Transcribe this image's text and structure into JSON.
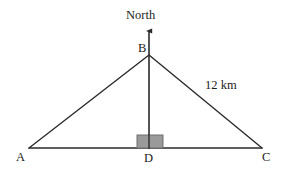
{
  "figure": {
    "type": "geometry-diagram",
    "background_color": "#ffffff",
    "stroke_color": "#2b2b2b",
    "right_angle_fill": "#9a9a9a",
    "right_angle_stroke": "#6e6e6e"
  },
  "labels": {
    "north": "North",
    "apex": "B",
    "left_vertex": "A",
    "foot": "D",
    "right_vertex": "C",
    "side_measure": "12 km"
  },
  "geometry": {
    "points": {
      "A": {
        "x": 29,
        "y": 148
      },
      "B": {
        "x": 149,
        "y": 55
      },
      "C": {
        "x": 262,
        "y": 148
      },
      "D": {
        "x": 149,
        "y": 148
      },
      "north_arrow_tip": {
        "x": 149,
        "y": 28
      }
    },
    "segments": [
      {
        "name": "AB",
        "from": "A",
        "to": "B"
      },
      {
        "name": "BC",
        "from": "B",
        "to": "C"
      },
      {
        "name": "AC",
        "from": "A",
        "to": "C"
      },
      {
        "name": "BD",
        "from": "B",
        "to": "D"
      }
    ],
    "right_angle_marker": {
      "x": 137,
      "y": 135,
      "width": 26,
      "height": 13,
      "at": "D"
    }
  },
  "label_positions": {
    "north": {
      "x": 126,
      "y": 9
    },
    "apex": {
      "x": 138,
      "y": 42
    },
    "side_measure": {
      "x": 205,
      "y": 79
    },
    "left_vertex": {
      "x": 16,
      "y": 151
    },
    "foot": {
      "x": 144,
      "y": 152
    },
    "right_vertex": {
      "x": 262,
      "y": 151
    }
  }
}
